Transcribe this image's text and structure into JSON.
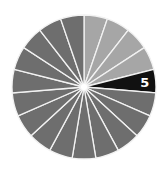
{
  "chart_data": {
    "type": "pie",
    "title": "",
    "slice_count": 19,
    "categories": [
      "1",
      "2",
      "3",
      "4",
      "5",
      "6",
      "7",
      "8",
      "9",
      "10",
      "11",
      "12",
      "13",
      "14",
      "15",
      "16",
      "17",
      "18",
      "19"
    ],
    "values": [
      1,
      1,
      1,
      1,
      1,
      1,
      1,
      1,
      1,
      1,
      1,
      1,
      1,
      1,
      1,
      1,
      1,
      1,
      1
    ],
    "highlighted": "5",
    "labels_shown": [
      {
        "slice": 5,
        "text": "5"
      }
    ],
    "start_angle_deg": 0,
    "direction": "clockwise",
    "colors": {
      "light": "#a6a6a6",
      "dark": "#6e6e6e",
      "highlight": "#111111",
      "separator": "#f2f2f2",
      "label": "#ffffff"
    },
    "slice_colors": [
      "light",
      "light",
      "light",
      "light",
      "highlight",
      "dark",
      "dark",
      "dark",
      "dark",
      "dark",
      "dark",
      "dark",
      "dark",
      "dark",
      "dark",
      "dark",
      "dark",
      "dark",
      "dark"
    ]
  }
}
